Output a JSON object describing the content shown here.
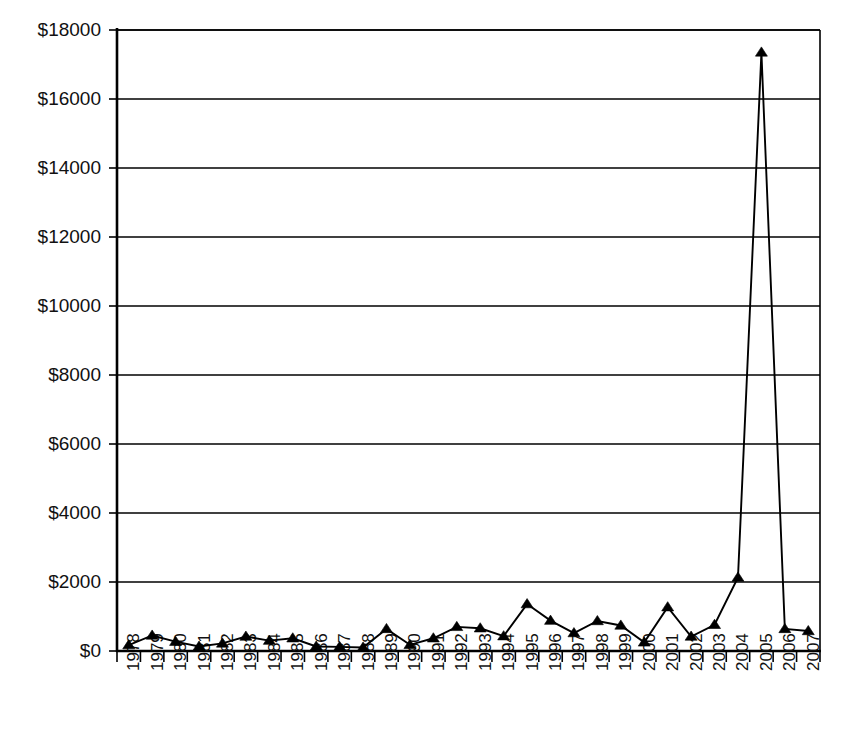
{
  "chart_data": {
    "type": "line",
    "title": "",
    "subtitle": "",
    "xlabel": "",
    "ylabel": "",
    "grid": true,
    "legend": false,
    "legend_position": "none",
    "marker": "triangle",
    "line_color": "#000000",
    "marker_color": "#000000",
    "background_color": "#ffffff",
    "xlim": [
      1977.5,
      2007.5
    ],
    "ylim": [
      0,
      18000
    ],
    "ytick_step": 2000,
    "ytick_labels": [
      "$0",
      "$2000",
      "$4000",
      "$6000",
      "$8000",
      "$10000",
      "$12000",
      "$14000",
      "$16000",
      "$18000"
    ],
    "ytick_values": [
      0,
      2000,
      4000,
      6000,
      8000,
      10000,
      12000,
      14000,
      16000,
      18000
    ],
    "categories": [
      "1978",
      "1979",
      "1980",
      "1981",
      "1982",
      "1983",
      "1984",
      "1985",
      "1986",
      "1987",
      "1988",
      "1989",
      "1990",
      "1991",
      "1992",
      "1993",
      "1994",
      "1995",
      "1996",
      "1997",
      "1998",
      "1999",
      "2000",
      "2001",
      "2002",
      "2003",
      "2004",
      "2005",
      "2006",
      "2007"
    ],
    "values": [
      170,
      450,
      270,
      130,
      220,
      420,
      300,
      370,
      130,
      120,
      100,
      640,
      180,
      370,
      700,
      660,
      430,
      1360,
      880,
      520,
      870,
      740,
      250,
      1270,
      420,
      760,
      2130,
      17350,
      640,
      580
    ],
    "series": [
      {
        "name": "Series 1",
        "values": [
          170,
          450,
          270,
          130,
          220,
          420,
          300,
          370,
          130,
          120,
          100,
          640,
          180,
          370,
          700,
          660,
          430,
          1360,
          880,
          520,
          870,
          740,
          250,
          1270,
          420,
          760,
          2130,
          17350,
          640,
          580
        ]
      }
    ],
    "annotations": []
  }
}
